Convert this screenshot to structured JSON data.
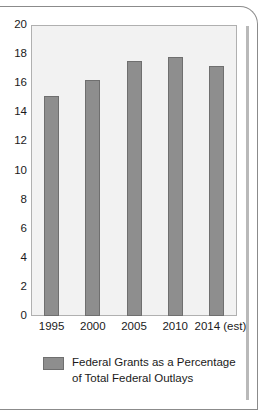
{
  "chart_data": {
    "type": "bar",
    "title": "",
    "subtitle": "",
    "xlabel": "",
    "ylabel": "",
    "categories": [
      "1995",
      "2000",
      "2005",
      "2010",
      "2014 (est)"
    ],
    "values": [
      15.1,
      16.2,
      17.5,
      17.8,
      17.2
    ],
    "series": [
      {
        "name": "Federal Grants as a Percentage of Total Federal Outlays",
        "values": [
          15.1,
          16.2,
          17.5,
          17.8,
          17.2
        ]
      }
    ],
    "ylim": [
      0,
      20
    ],
    "yticks": [
      0,
      2,
      4,
      6,
      8,
      10,
      12,
      14,
      16,
      18,
      20
    ],
    "ytick_labels": [
      "0",
      "2",
      "4",
      "6",
      "8",
      "10",
      "12",
      "14",
      "16",
      "18",
      "20"
    ],
    "grid": false,
    "legend": {
      "position": "bottom",
      "entries": [
        {
          "label_line1": "Federal Grants as a Percentage",
          "label_line2": "of Total Federal Outlays",
          "color": "#8e8e8e"
        }
      ]
    },
    "colors": {
      "bar_fill": "#8e8e8e",
      "bar_stroke": "#6f6f6f",
      "plot_background": "#f2f2f2",
      "plot_border": "#b0b0b0",
      "text": "#1a1a1a",
      "frame": "#8b8b8b"
    }
  },
  "footer": {
    "source_text": ""
  }
}
